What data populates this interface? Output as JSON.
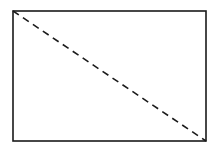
{
  "diagram": {
    "shape": "rectangle",
    "rect": {
      "x": 13,
      "y": 11,
      "width": 193,
      "height": 130
    },
    "diagonal": {
      "x1": 13,
      "y1": 11,
      "x2": 206,
      "y2": 141,
      "style": "dashed"
    },
    "stroke_color": "#1a1a1a",
    "background_color": "#ffffff"
  }
}
